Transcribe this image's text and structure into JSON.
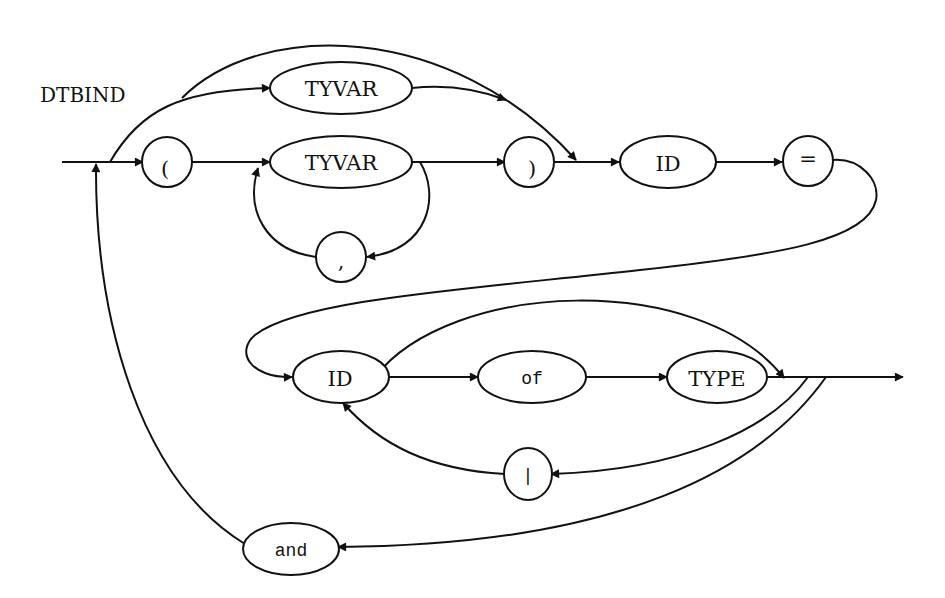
{
  "diagram": {
    "title": "DTBIND",
    "nodes": [
      {
        "id": "lparen",
        "label": "(",
        "shape": "circle",
        "font": "serif"
      },
      {
        "id": "tyvar_single",
        "label": "TYVAR",
        "shape": "ellipse",
        "font": "serif"
      },
      {
        "id": "tyvar_list",
        "label": "TYVAR",
        "shape": "ellipse",
        "font": "serif"
      },
      {
        "id": "comma",
        "label": ",",
        "shape": "circle",
        "font": "serif"
      },
      {
        "id": "rparen",
        "label": ")",
        "shape": "circle",
        "font": "serif"
      },
      {
        "id": "id_name",
        "label": "ID",
        "shape": "ellipse",
        "font": "serif"
      },
      {
        "id": "equals",
        "label": "=",
        "shape": "circle",
        "font": "serif"
      },
      {
        "id": "id_ctor",
        "label": "ID",
        "shape": "ellipse",
        "font": "serif"
      },
      {
        "id": "of_kw",
        "label": "of",
        "shape": "ellipse",
        "font": "mono"
      },
      {
        "id": "type",
        "label": "TYPE",
        "shape": "ellipse",
        "font": "serif"
      },
      {
        "id": "bar",
        "label": "|",
        "shape": "circle",
        "font": "mono"
      },
      {
        "id": "and_kw",
        "label": "and",
        "shape": "ellipse",
        "font": "mono"
      }
    ],
    "edges": [
      {
        "from": "entry",
        "to": "lparen"
      },
      {
        "from": "entry",
        "to": "tyvar_single"
      },
      {
        "from": "entry",
        "to": "id_name",
        "note": "bypass over type variables"
      },
      {
        "from": "tyvar_single",
        "to": "id_name"
      },
      {
        "from": "lparen",
        "to": "tyvar_list"
      },
      {
        "from": "tyvar_list",
        "to": "rparen"
      },
      {
        "from": "tyvar_list",
        "to": "comma"
      },
      {
        "from": "comma",
        "to": "tyvar_list"
      },
      {
        "from": "rparen",
        "to": "id_name"
      },
      {
        "from": "id_name",
        "to": "equals"
      },
      {
        "from": "equals",
        "to": "id_ctor"
      },
      {
        "from": "id_ctor",
        "to": "of_kw"
      },
      {
        "from": "id_ctor",
        "to": "after_type",
        "note": "bypass 'of TYPE'"
      },
      {
        "from": "of_kw",
        "to": "type"
      },
      {
        "from": "type",
        "to": "exit"
      },
      {
        "from": "after_type",
        "to": "bar"
      },
      {
        "from": "bar",
        "to": "id_ctor"
      },
      {
        "from": "after_type",
        "to": "and_kw"
      },
      {
        "from": "and_kw",
        "to": "entry"
      }
    ]
  }
}
